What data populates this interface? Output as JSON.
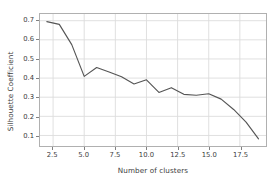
{
  "chart_data": {
    "type": "line",
    "title": "",
    "xlabel": "Number of clusters",
    "ylabel": "Silhouette Coefficient",
    "xlim": [
      1.45,
      19.6
    ],
    "ylim": [
      0.045,
      0.735
    ],
    "grid": true,
    "legend": null,
    "line_color": "#555555",
    "x": [
      2,
      3,
      4,
      5,
      6,
      7,
      8,
      9,
      10,
      11,
      12,
      13,
      14,
      15,
      16,
      17,
      18,
      19
    ],
    "values": [
      0.695,
      0.681,
      0.575,
      0.409,
      0.455,
      0.432,
      0.407,
      0.369,
      0.391,
      0.325,
      0.35,
      0.315,
      0.31,
      0.318,
      0.29,
      0.236,
      0.17,
      0.082
    ],
    "xticks": [
      2.5,
      5.0,
      7.5,
      10.0,
      12.5,
      15.0,
      17.5
    ],
    "xticklabels": [
      "2.5",
      "5.0",
      "7.5",
      "10.0",
      "12.5",
      "15.0",
      "17.5"
    ],
    "yticks": [
      0.1,
      0.2,
      0.3,
      0.4,
      0.5,
      0.6,
      0.7
    ],
    "yticklabels": [
      "0.1",
      "0.2",
      "0.3",
      "0.4",
      "0.5",
      "0.6",
      "0.7"
    ]
  }
}
